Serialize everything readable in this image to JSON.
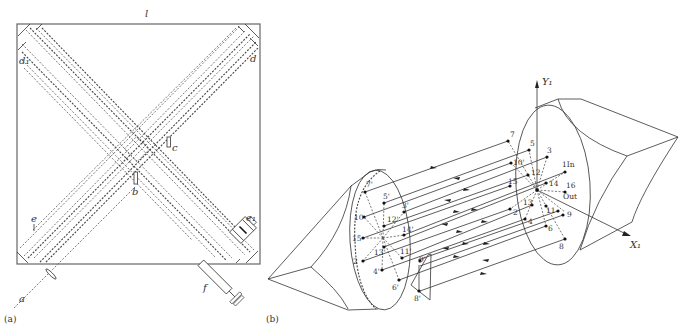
{
  "figure": {
    "panel_a": {
      "caption": "(a)",
      "labels": {
        "top": "l",
        "mirror_left": "d₁",
        "mirror_right": "d",
        "element_b": "b",
        "element_c": "c",
        "element_e": "e",
        "element_e1": "e₁",
        "element_f": "f",
        "input_a": "a"
      }
    },
    "panel_b": {
      "caption": "(b)",
      "axes": {
        "y": "Y₁",
        "x": "X₁"
      },
      "right_mirror_points": [
        "7",
        "5",
        "3",
        "10'",
        "12",
        "1In",
        "15",
        "14",
        "16",
        "Out",
        "13",
        "2",
        "11",
        "9",
        "4",
        "6",
        "8"
      ],
      "left_mirror_points": [
        "7'",
        "5'",
        "3'",
        "10",
        "12'",
        "14'",
        "15",
        "13'",
        "11'",
        "2",
        "4'",
        "6'",
        "9'",
        "8'"
      ],
      "in_label": "In",
      "out_label": "Out"
    }
  }
}
